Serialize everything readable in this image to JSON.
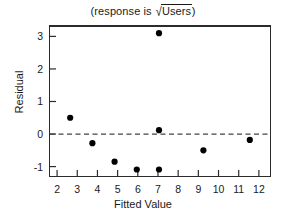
{
  "chart_data": {
    "type": "scatter",
    "title": "(response is √Users)",
    "title_prefix": "(response is ",
    "title_sqrt_symbol": "√",
    "title_radicand": "Users",
    "title_suffix": ")",
    "xlabel": "Fitted Value",
    "ylabel": "Residual",
    "xlim": [
      1.6,
      12.6
    ],
    "ylim": [
      -1.32,
      3.35
    ],
    "xticks": [
      2,
      3,
      4,
      5,
      6,
      7,
      8,
      9,
      10,
      11,
      12
    ],
    "yticks": [
      3,
      2,
      1,
      0,
      -1
    ],
    "xtick_labels": [
      "2",
      "3",
      "4",
      "5",
      "6",
      "7",
      "8",
      "9",
      "10",
      "11",
      "12"
    ],
    "ytick_labels": [
      "3",
      "2",
      "1",
      "0",
      "-1"
    ],
    "grid": false,
    "legend": false,
    "reference_line": {
      "axis": "y",
      "value": 0,
      "style": "dashed",
      "color": "#444444"
    },
    "marker": {
      "shape": "circle",
      "color": "#000000",
      "size": 5
    },
    "points": [
      {
        "x": 2.65,
        "y": 0.5
      },
      {
        "x": 3.75,
        "y": -0.28
      },
      {
        "x": 4.85,
        "y": -0.85
      },
      {
        "x": 5.95,
        "y": -1.09
      },
      {
        "x": 7.05,
        "y": 3.1
      },
      {
        "x": 7.05,
        "y": 0.12
      },
      {
        "x": 7.05,
        "y": -1.09
      },
      {
        "x": 9.25,
        "y": -0.5
      },
      {
        "x": 11.55,
        "y": -0.18
      }
    ]
  },
  "colors": {
    "axis": "#2b2b2b",
    "marker": "#000000",
    "reference_line": "#444444",
    "text": "#1a1a1a",
    "background": "#ffffff"
  }
}
